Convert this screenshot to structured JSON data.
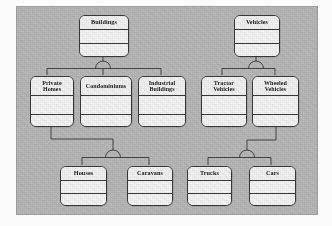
{
  "diagram": {
    "kind": "uml-generalization-hierarchy",
    "notation": "semicircle-generalization",
    "panel_color": "#b9b9b9",
    "box_fill": "#f2f2f2",
    "line_color": "#3a3a3a",
    "classes": [
      {
        "id": "buildings",
        "name": "Buildings",
        "row": 1,
        "x": 78,
        "y": 14,
        "w": 50,
        "h": 42
      },
      {
        "id": "vehicles",
        "name": "Vehicles",
        "row": 1,
        "x": 233,
        "y": 14,
        "w": 46,
        "h": 42
      },
      {
        "id": "private-homes",
        "name": "Private Homes",
        "row": 2,
        "x": 29,
        "y": 75,
        "w": 44,
        "h": 51
      },
      {
        "id": "condominiums",
        "name": "Condominiums",
        "row": 2,
        "x": 79,
        "y": 75,
        "w": 52,
        "h": 51
      },
      {
        "id": "industrial-buildings",
        "name": "Industrial Buildings",
        "row": 2,
        "x": 137,
        "y": 75,
        "w": 48,
        "h": 51
      },
      {
        "id": "tractor-vehicles",
        "name": "Tractor Vehicles",
        "row": 2,
        "x": 200,
        "y": 75,
        "w": 46,
        "h": 51
      },
      {
        "id": "wheeled-vehicles",
        "name": "Wheeled Vehicles",
        "row": 2,
        "x": 251,
        "y": 75,
        "w": 47,
        "h": 51
      },
      {
        "id": "houses",
        "name": "Houses",
        "row": 3,
        "x": 59,
        "y": 165,
        "w": 47,
        "h": 40
      },
      {
        "id": "caravans",
        "name": "Caravans",
        "row": 3,
        "x": 126,
        "y": 165,
        "w": 46,
        "h": 40
      },
      {
        "id": "trucks",
        "name": "Trucks",
        "row": 3,
        "x": 186,
        "y": 165,
        "w": 45,
        "h": 40
      },
      {
        "id": "cars",
        "name": "Cars",
        "row": 3,
        "x": 248,
        "y": 165,
        "w": 47,
        "h": 40
      }
    ],
    "generalizations": [
      {
        "id": "gen-buildings",
        "parent": "Buildings",
        "children": [
          "Private Homes",
          "Condominiums",
          "Industrial Buildings"
        ]
      },
      {
        "id": "gen-vehicles",
        "parent": "Vehicles",
        "children": [
          "Tractor Vehicles",
          "Wheeled Vehicles"
        ]
      },
      {
        "id": "gen-private-homes",
        "parent": "Private Homes",
        "children": [
          "Houses",
          "Caravans"
        ]
      },
      {
        "id": "gen-wheeled-vehicles",
        "parent": "Wheeled Vehicles",
        "children": [
          "Trucks",
          "Cars"
        ]
      }
    ]
  }
}
